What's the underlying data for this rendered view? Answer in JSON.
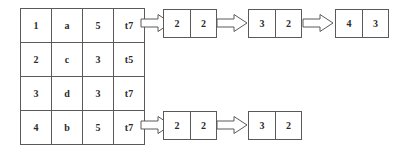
{
  "diagram": {
    "kind": "relation-to-pair-chains-diagram",
    "background_color": "#ffffff",
    "line_color": "#5a5a5a",
    "text_color": "#2b2b2b",
    "relation_table": {
      "name": "source-relation-table",
      "columns": 4,
      "rows": [
        [
          "1",
          "a",
          "5",
          "t7"
        ],
        [
          "2",
          "c",
          "3",
          "t5"
        ],
        [
          "3",
          "d",
          "3",
          "t7"
        ],
        [
          "4",
          "b",
          "5",
          "t7"
        ]
      ]
    },
    "chains": [
      {
        "name": "top-chain",
        "pairs": [
          {
            "left": "2",
            "right": "2"
          },
          {
            "left": "3",
            "right": "2"
          },
          {
            "left": "4",
            "right": "3"
          }
        ],
        "arrows": [
          "block-arrow-right",
          "block-arrow-right",
          "block-arrow-right"
        ]
      },
      {
        "name": "bottom-chain",
        "pairs": [
          {
            "left": "2",
            "right": "2"
          },
          {
            "left": "3",
            "right": "2"
          }
        ],
        "arrows": [
          "block-arrow-right",
          "block-arrow-right"
        ]
      }
    ]
  }
}
